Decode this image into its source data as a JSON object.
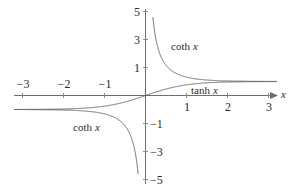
{
  "chart_data": {
    "type": "line",
    "title": "",
    "xlabel": "x",
    "ylabel": "",
    "xlim": [
      -3.2,
      3.2
    ],
    "ylim": [
      -5.6,
      5.6
    ],
    "grid": false,
    "legend_position": "inline-annotations",
    "xticks": [
      -3,
      -2,
      -1,
      1,
      2,
      3
    ],
    "xtick_labels": [
      "−3",
      "−2",
      "−1",
      "1",
      "2",
      "3"
    ],
    "yticks": [
      5,
      3,
      1,
      -1,
      -3,
      -5
    ],
    "ytick_labels": [
      "5",
      "3",
      "1",
      "−1",
      "−3",
      "−5"
    ],
    "series": [
      {
        "name": "tanh x",
        "label": "tanh",
        "variable": "x",
        "color": "#5a5a5a",
        "asymptotes": [
          1,
          -1
        ],
        "description": "tanh x, passes through origin, bounded between -1 and 1"
      },
      {
        "name": "coth x",
        "label": "coth",
        "variable": "x",
        "color": "#5a5a5a",
        "asymptotes": [
          1,
          -1,
          0
        ],
        "description": "coth x, two branches with vertical asymptote at x = 0"
      }
    ],
    "annotations": [
      {
        "id": "coth-upper",
        "text": "coth",
        "variable": "x",
        "x": 0.85,
        "y": 2.55
      },
      {
        "id": "tanh-right",
        "text": "tanh",
        "variable": "x",
        "x": 1.35,
        "y": 0.52
      },
      {
        "id": "coth-lower",
        "text": "coth",
        "variable": "x",
        "x": -1.45,
        "y": -2.15
      }
    ],
    "axis_arrow_label": "x"
  },
  "figure": {
    "background_color": "#ffffff",
    "axis_color": "#6e6e6e",
    "curve_color": "#5a5a5a",
    "text_color": "#2b2b2b"
  }
}
